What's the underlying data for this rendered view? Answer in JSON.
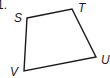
{
  "problem": {
    "number": "1."
  },
  "figure": {
    "type": "quadrilateral",
    "stroke_color": "#1a1a1a",
    "vertices": [
      {
        "label": "S",
        "x": 27,
        "y": 18
      },
      {
        "label": "T",
        "x": 72,
        "y": 9
      },
      {
        "label": "U",
        "x": 96,
        "y": 57
      },
      {
        "label": "V",
        "x": 24,
        "y": 71
      }
    ]
  }
}
